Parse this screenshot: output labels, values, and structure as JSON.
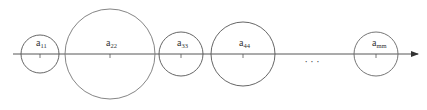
{
  "diagram": {
    "axis": {
      "y": 54,
      "x_start": 13,
      "x_end": 418,
      "color": "#444444"
    },
    "circles": [
      {
        "id": "a11",
        "base": "a",
        "sub": "11",
        "cx": 40,
        "r": 19,
        "stroke": "#555555"
      },
      {
        "id": "a22",
        "base": "a",
        "sub": "22",
        "cx": 110,
        "r": 45,
        "stroke": "#777777"
      },
      {
        "id": "a33",
        "base": "a",
        "sub": "33",
        "cx": 181,
        "r": 22,
        "stroke": "#555555"
      },
      {
        "id": "a44",
        "base": "a",
        "sub": "44",
        "cx": 243,
        "r": 32,
        "stroke": "#555555"
      },
      {
        "id": "amm",
        "base": "a",
        "sub": "mm",
        "cx": 376,
        "r": 22,
        "stroke": "#666666"
      }
    ],
    "ellipsis": {
      "text": "· · ·",
      "x": 312,
      "y": 65
    }
  }
}
